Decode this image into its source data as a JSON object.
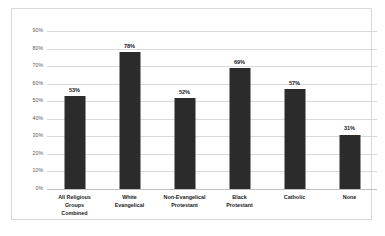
{
  "chart_data": {
    "type": "bar",
    "title": "",
    "subtitle": "",
    "xlabel": "",
    "ylabel": "",
    "ylim": [
      0,
      90
    ],
    "grid": true,
    "legend": "none",
    "orientation": "vertical",
    "bar_color": "#2b2b2b",
    "gridline_color": "#d9d9d9",
    "frame_color": "#d9d9d9",
    "plot_background": "#ffffff",
    "ytick_labels": [
      "90%",
      "80%",
      "70%",
      "60%",
      "50%",
      "40%",
      "30%",
      "20%",
      "10%",
      "0%"
    ],
    "ytick_values": [
      90,
      80,
      70,
      60,
      50,
      40,
      30,
      20,
      10,
      0
    ],
    "categories": [
      "All Religious Groups Combined",
      "White Evangelical",
      "Non-Evangelical Protestant",
      "Black Protestant",
      "Catholic",
      "None"
    ],
    "category_lines": [
      [
        "All Religious",
        "Groups",
        "Combined"
      ],
      [
        "White",
        "Evangelical"
      ],
      [
        "Non-Evangelical",
        "Protestant"
      ],
      [
        "Black",
        "Protestant"
      ],
      [
        "Catholic"
      ],
      [
        "None"
      ]
    ],
    "values": [
      53,
      78,
      52,
      69,
      57,
      31
    ],
    "data_labels": [
      "53%",
      "78%",
      "52%",
      "69%",
      "57%",
      "31%"
    ]
  }
}
